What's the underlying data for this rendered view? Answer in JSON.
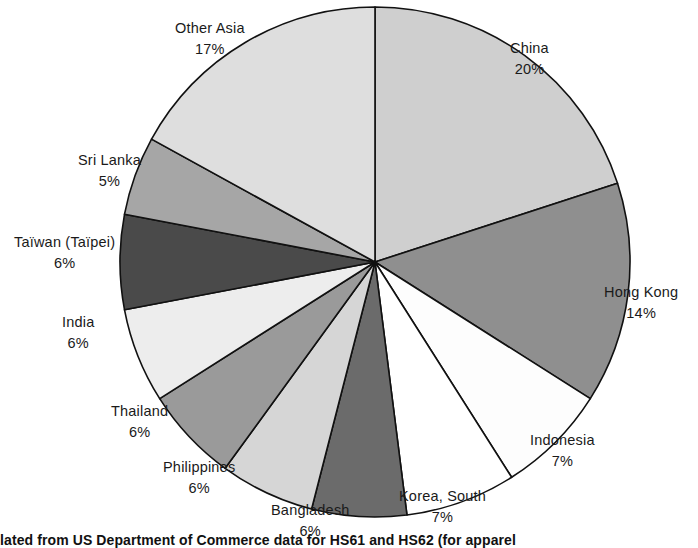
{
  "figure": {
    "caption": "lated from US Department of Commerce data for HS61 and HS62 (for apparel"
  },
  "chart_data": {
    "type": "pie",
    "title": "",
    "xlabel": "",
    "ylabel": "",
    "legend_position": "none",
    "grid": false,
    "start_angle_deg": 0,
    "direction": "clockwise",
    "units": "percent",
    "categories": [
      "China",
      "Hong Kong",
      "Indonesia",
      "Korea,  South",
      "Bangladesh",
      "Philippines",
      "Thailand",
      "India",
      "Taïwan  (Taïpei)",
      "Sri  Lanka",
      "Other  Asia"
    ],
    "values": [
      20,
      14,
      7,
      7,
      6,
      6,
      6,
      6,
      6,
      5,
      17
    ],
    "value_labels": [
      "20%",
      "14%",
      "7%",
      "7%",
      "6%",
      "6%",
      "6%",
      "6%",
      "6%",
      "5%",
      "17%"
    ],
    "slice_colors": [
      "#cfcfcf",
      "#8f8f8f",
      "#fdfdfd",
      "#ffffff",
      "#6b6b6b",
      "#d6d6d6",
      "#9a9a9a",
      "#ededed",
      "#4a4a4a",
      "#a6a6a6",
      "#dedede"
    ],
    "outline_color": "#111111",
    "slices": [
      {
        "label": "China",
        "pct": "20%",
        "value": 20,
        "color": "#cfcfcf",
        "label_x": 510,
        "label_y": 38
      },
      {
        "label": "Hong Kong",
        "pct": "14%",
        "value": 14,
        "color": "#8f8f8f",
        "label_x": 604,
        "label_y": 282
      },
      {
        "label": "Indonesia",
        "pct": "7%",
        "value": 7,
        "color": "#fdfdfd",
        "label_x": 530,
        "label_y": 430
      },
      {
        "label": "Korea,  South",
        "pct": "7%",
        "value": 7,
        "color": "#ffffff",
        "label_x": 399,
        "label_y": 486
      },
      {
        "label": "Bangladesh",
        "pct": "6%",
        "value": 6,
        "color": "#6b6b6b",
        "label_x": 271,
        "label_y": 500
      },
      {
        "label": "Philippines",
        "pct": "6%",
        "value": 6,
        "color": "#d6d6d6",
        "label_x": 163,
        "label_y": 457
      },
      {
        "label": "Thailand",
        "pct": "6%",
        "value": 6,
        "color": "#9a9a9a",
        "label_x": 111,
        "label_y": 401
      },
      {
        "label": "India",
        "pct": "6%",
        "value": 6,
        "color": "#ededed",
        "label_x": 62,
        "label_y": 312
      },
      {
        "label": "Taïwan  (Taïpei)",
        "pct": "6%",
        "value": 6,
        "color": "#4a4a4a",
        "label_x": 14,
        "label_y": 232
      },
      {
        "label": "Sri  Lanka",
        "pct": "5%",
        "value": 5,
        "color": "#a6a6a6",
        "label_x": 78,
        "label_y": 150
      },
      {
        "label": "Other  Asia",
        "pct": "17%",
        "value": 17,
        "color": "#dedede",
        "label_x": 175,
        "label_y": 18
      }
    ],
    "geometry": {
      "cx": 375,
      "cy": 262,
      "r": 255
    }
  }
}
